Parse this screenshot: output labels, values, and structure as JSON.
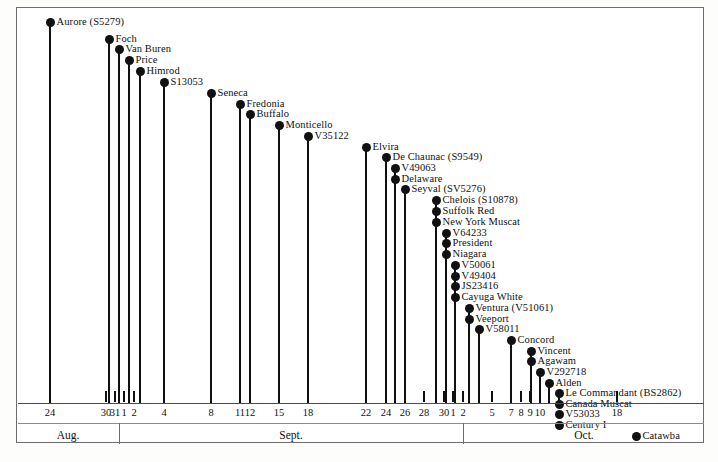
{
  "chart_data": {
    "type": "scatter",
    "title": "",
    "subtitle": "",
    "xlabel": "",
    "ylabel": "",
    "grid": false,
    "legend": "none",
    "axis": {
      "type": "date",
      "months": [
        {
          "label": "Aug.",
          "start_day": 24,
          "end_day": 31
        },
        {
          "label": "Sept.",
          "start_day": 1,
          "end_day": 30
        },
        {
          "label": "Oct.",
          "start_day": 1,
          "end_day": 18
        }
      ],
      "tick_labels": [
        "24",
        "30",
        "31",
        "1",
        "2",
        "4",
        "8",
        "11",
        "12",
        "15",
        "18",
        "22",
        "24",
        "26",
        "28",
        "30",
        "1",
        "2",
        "5",
        "7",
        "8",
        "9",
        "10",
        "18"
      ]
    },
    "categories": [
      "Aurore (S5279)",
      "Foch",
      "Van Buren",
      "Price",
      "Himrod",
      "S13053",
      "Seneca",
      "Fredonia",
      "Buffalo",
      "Monticello",
      "V35122",
      "Elvira",
      "De Chaunac (S9549)",
      "V49063",
      "Delaware",
      "Seyval (SV5276)",
      "Chelois (S10878)",
      "Suffolk Red",
      "New York Muscat",
      "V64233",
      "President",
      "Niagara",
      "V50061",
      "V49404",
      "JS23416",
      "Cayuga White",
      "Ventura (V51061)",
      "Veeport",
      "V58011",
      "Concord",
      "Vincent",
      "Agawam",
      "V292718",
      "Alden",
      "Le Commandant (BS2862)",
      "Canada Muscat",
      "V53033",
      "Century I",
      "Catawba"
    ],
    "points": [
      {
        "label": "Aurore (S5279)",
        "date": "Aug 24",
        "month": "Aug.",
        "day": 24
      },
      {
        "label": "Foch",
        "date": "Aug 30",
        "month": "Aug.",
        "day": 30
      },
      {
        "label": "Van Buren",
        "date": "Aug 31",
        "month": "Aug.",
        "day": 31
      },
      {
        "label": "Price",
        "date": "Sept 1",
        "month": "Sept.",
        "day": 1
      },
      {
        "label": "Himrod",
        "date": "Sept 2",
        "month": "Sept.",
        "day": 2
      },
      {
        "label": "S13053",
        "date": "Sept 4",
        "month": "Sept.",
        "day": 4
      },
      {
        "label": "Seneca",
        "date": "Sept 8",
        "month": "Sept.",
        "day": 8
      },
      {
        "label": "Fredonia",
        "date": "Sept 11",
        "month": "Sept.",
        "day": 11
      },
      {
        "label": "Buffalo",
        "date": "Sept 12",
        "month": "Sept.",
        "day": 12
      },
      {
        "label": "Monticello",
        "date": "Sept 15",
        "month": "Sept.",
        "day": 15
      },
      {
        "label": "V35122",
        "date": "Sept 18",
        "month": "Sept.",
        "day": 18
      },
      {
        "label": "Elvira",
        "date": "Sept 22",
        "month": "Sept.",
        "day": 22
      },
      {
        "label": "De Chaunac (S9549)",
        "date": "Sept 24",
        "month": "Sept.",
        "day": 24
      },
      {
        "label": "V49063",
        "date": "Sept 25",
        "month": "Sept.",
        "day": 25
      },
      {
        "label": "Delaware",
        "date": "Sept 25",
        "month": "Sept.",
        "day": 25
      },
      {
        "label": "Seyval (SV5276)",
        "date": "Sept 26",
        "month": "Sept.",
        "day": 26
      },
      {
        "label": "Chelois (S10878)",
        "date": "Sept 28",
        "month": "Sept.",
        "day": 28
      },
      {
        "label": "Suffolk Red",
        "date": "Sept 28",
        "month": "Sept.",
        "day": 28
      },
      {
        "label": "New York Muscat",
        "date": "Sept 28",
        "month": "Sept.",
        "day": 28
      },
      {
        "label": "V64233",
        "date": "Sept 29",
        "month": "Sept.",
        "day": 29
      },
      {
        "label": "President",
        "date": "Sept 29",
        "month": "Sept.",
        "day": 29
      },
      {
        "label": "Niagara",
        "date": "Sept 29",
        "month": "Sept.",
        "day": 29
      },
      {
        "label": "V50061",
        "date": "Sept 30",
        "month": "Sept.",
        "day": 30
      },
      {
        "label": "V49404",
        "date": "Sept 30",
        "month": "Sept.",
        "day": 30
      },
      {
        "label": "JS23416",
        "date": "Sept 30",
        "month": "Sept.",
        "day": 30
      },
      {
        "label": "Cayuga White",
        "date": "Sept 30",
        "month": "Sept.",
        "day": 30
      },
      {
        "label": "Ventura (V51061)",
        "date": "Oct 2",
        "month": "Oct.",
        "day": 2
      },
      {
        "label": "Veeport",
        "date": "Oct 2",
        "month": "Oct.",
        "day": 2
      },
      {
        "label": "V58011",
        "date": "Oct 3",
        "month": "Oct.",
        "day": 3
      },
      {
        "label": "Concord",
        "date": "Oct 5",
        "month": "Oct.",
        "day": 5
      },
      {
        "label": "Vincent",
        "date": "Oct 7",
        "month": "Oct.",
        "day": 7
      },
      {
        "label": "Agawam",
        "date": "Oct 7",
        "month": "Oct.",
        "day": 7
      },
      {
        "label": "V292718",
        "date": "Oct 8",
        "month": "Oct.",
        "day": 8
      },
      {
        "label": "Alden",
        "date": "Oct 9",
        "month": "Oct.",
        "day": 9
      },
      {
        "label": "Le Commandant (BS2862)",
        "date": "Oct 10",
        "month": "Oct.",
        "day": 10
      },
      {
        "label": "Canada Muscat",
        "date": "Oct 10",
        "month": "Oct.",
        "day": 10
      },
      {
        "label": "V53033",
        "date": "Oct 10",
        "month": "Oct.",
        "day": 10
      },
      {
        "label": "Century I",
        "date": "Oct 10",
        "month": "Oct.",
        "day": 10
      },
      {
        "label": "Catawba",
        "date": "Oct 18",
        "month": "Oct.",
        "day": 18
      }
    ]
  },
  "render": {
    "series_x": [
      49,
      108,
      118,
      128,
      139,
      163,
      210,
      239,
      249,
      278,
      307,
      365,
      385,
      394,
      394,
      404,
      435,
      435,
      435,
      445,
      445,
      445,
      454,
      454,
      454,
      454,
      468,
      468,
      478,
      510,
      530,
      530,
      539,
      548,
      558,
      558,
      558,
      558,
      635
    ],
    "series_y": [
      21,
      38,
      48,
      59,
      70,
      81,
      92,
      103,
      113,
      124,
      135,
      146,
      156,
      167,
      178,
      188,
      199,
      210,
      221,
      232,
      242,
      253,
      264,
      275,
      285,
      296,
      307,
      318,
      328,
      339,
      350,
      360,
      371,
      382,
      392,
      403,
      413,
      424,
      435
    ],
    "ticks": [
      {
        "x": 49,
        "label": "24"
      },
      {
        "x": 105,
        "label": "30"
      },
      {
        "x": 114,
        "label": "31"
      },
      {
        "x": 123,
        "label": "1"
      },
      {
        "x": 133,
        "label": "2"
      },
      {
        "x": 163,
        "label": "4"
      },
      {
        "x": 210,
        "label": "8"
      },
      {
        "x": 239,
        "label": "11"
      },
      {
        "x": 249,
        "label": "12"
      },
      {
        "x": 278,
        "label": "15"
      },
      {
        "x": 307,
        "label": "18"
      },
      {
        "x": 365,
        "label": "22"
      },
      {
        "x": 385,
        "label": "24"
      },
      {
        "x": 404,
        "label": "26"
      },
      {
        "x": 423,
        "label": "28"
      },
      {
        "x": 443,
        "label": "30"
      },
      {
        "x": 452,
        "label": "1"
      },
      {
        "x": 462,
        "label": "2"
      },
      {
        "x": 491,
        "label": "5"
      },
      {
        "x": 510,
        "label": "7"
      },
      {
        "x": 520,
        "label": "8"
      },
      {
        "x": 529,
        "label": "9"
      },
      {
        "x": 539,
        "label": "10"
      },
      {
        "x": 616,
        "label": "18"
      }
    ],
    "month_dividers": [
      118,
      462
    ],
    "month_bands": [
      {
        "label": "Aug.",
        "center": 67
      },
      {
        "label": "Sept.",
        "center": 290
      },
      {
        "label": "Oct.",
        "center": 583
      }
    ],
    "colors": {
      "ink": "#111111",
      "frame": "#6d6d6d",
      "axis": "#4a4a4a",
      "paper": "#ffffff"
    }
  }
}
